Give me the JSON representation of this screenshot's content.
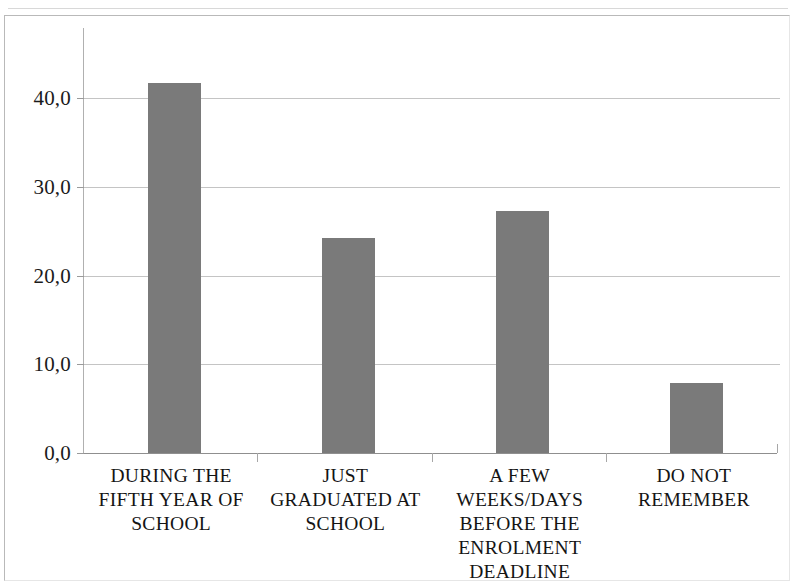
{
  "chart_data": {
    "type": "bar",
    "title": "",
    "subtitle": "",
    "xlabel": "",
    "ylabel": "",
    "categories": [
      "DURING THE FIFTH YEAR OF SCHOOL",
      "JUST GRADUATED AT SCHOOL",
      "A FEW WEEKS/DAYS BEFORE THE ENROLMENT DEADLINE",
      "DO NOT REMEMBER"
    ],
    "category_lines": [
      [
        "DURING THE",
        "FIFTH YEAR OF",
        "SCHOOL"
      ],
      [
        "JUST",
        "GRADUATED AT",
        "SCHOOL"
      ],
      [
        "A FEW",
        "WEEKS/DAYS",
        "BEFORE THE",
        "ENROLMENT",
        "DEADLINE"
      ],
      [
        "DO NOT",
        "REMEMBER"
      ]
    ],
    "values": [
      41.7,
      24.2,
      27.3,
      7.9
    ],
    "ylim": [
      0,
      45
    ],
    "ytick_values": [
      0,
      10,
      20,
      30,
      40
    ],
    "ytick_labels": [
      "0,0",
      "10,0",
      "20,0",
      "30,0",
      "40,0"
    ],
    "grid": true,
    "legend": false,
    "legend_position": "none",
    "bar_color": "#7a7a7a",
    "gridline_color": "#c4c4c4",
    "axis_color": "#8f8f8f",
    "text_color": "#141414",
    "background_color": "#ffffff",
    "decimal_separator": ","
  }
}
